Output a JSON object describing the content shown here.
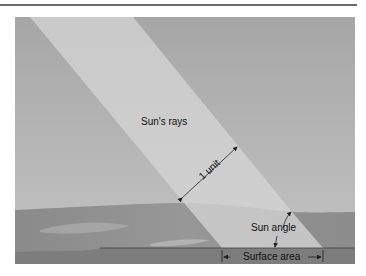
{
  "figure": {
    "labels": {
      "rays": "Sun's rays",
      "unit": "1 unit",
      "angle": "Sun angle",
      "surface": "Surface area"
    },
    "colors": {
      "sky": "#a9a9a9",
      "beam": "#cfcfcf",
      "ground": "#8f8f8f",
      "surface_band": "#7b7b7b",
      "line": "#333333"
    }
  }
}
